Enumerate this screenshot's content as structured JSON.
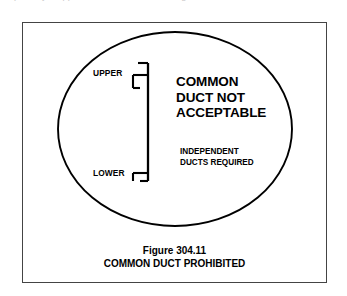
{
  "page": {
    "background_color": "#ffffff",
    "ink_color": "#000000",
    "frame_color": "#444444"
  },
  "top_cropped_text": "partially cropped line of text above the figure",
  "figure": {
    "frame": {
      "x": 22,
      "y": 22,
      "width": 305,
      "height": 261
    },
    "oval": {
      "center_x": 175,
      "center_y": 129,
      "radius_x": 117,
      "radius_y": 97,
      "stroke_color": "#000000",
      "stroke_width": 1.8
    },
    "labels": {
      "upper": "UPPER",
      "lower": "LOWER"
    },
    "message_primary": [
      "COMMON",
      "DUCT NOT",
      "ACCEPTABLE"
    ],
    "message_secondary": [
      "INDEPENDENT",
      "DUCTS REQUIRED"
    ]
  },
  "caption": {
    "figure_number": "Figure 304.11",
    "title": "COMMON DUCT PROHIBITED"
  }
}
